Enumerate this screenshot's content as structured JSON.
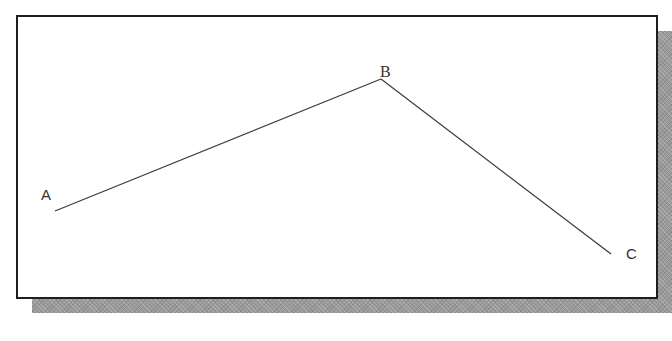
{
  "diagram": {
    "type": "polyline",
    "colors": {
      "line": "#3a3a3a",
      "frame_border": "#1e1e1e",
      "shadow": "#9a9a9a",
      "background": "#ffffff",
      "label": "#333333"
    },
    "points": [
      {
        "id": "A",
        "label": "A",
        "x": 55,
        "y": 211,
        "label_x": 41,
        "label_y": 187
      },
      {
        "id": "B",
        "label": "B",
        "x": 381,
        "y": 79,
        "label_x": 380,
        "label_y": 64
      },
      {
        "id": "C",
        "label": "C",
        "x": 611,
        "y": 254,
        "label_x": 626,
        "label_y": 246
      }
    ],
    "segments": [
      {
        "from": "A",
        "to": "B"
      },
      {
        "from": "B",
        "to": "C"
      }
    ]
  }
}
